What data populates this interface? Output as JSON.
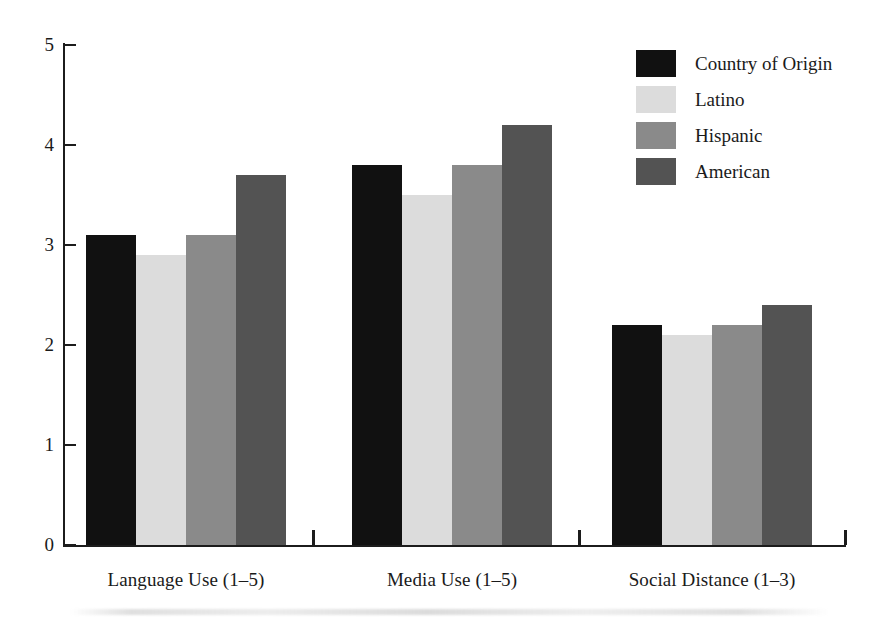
{
  "chart_data": {
    "type": "bar",
    "title": "",
    "subtitle": "",
    "xlabel": "",
    "ylabel": "",
    "ylim": [
      0,
      5
    ],
    "yticks": [
      0,
      1,
      2,
      3,
      4,
      5
    ],
    "ytick_labels": [
      "0",
      "1",
      "2",
      "3",
      "4",
      "5"
    ],
    "grid": false,
    "legend_position": "top-right",
    "categories": [
      "Language Use (1–5)",
      "Media Use (1–5)",
      "Social Distance (1–3)"
    ],
    "series": [
      {
        "name": "Country of Origin",
        "color": "#111111",
        "values": [
          3.1,
          3.8,
          2.2
        ]
      },
      {
        "name": "Latino",
        "color": "#dcdcdc",
        "values": [
          2.9,
          3.5,
          2.1
        ]
      },
      {
        "name": "Hispanic",
        "color": "#8a8a8a",
        "values": [
          3.1,
          3.8,
          2.2
        ]
      },
      {
        "name": "American",
        "color": "#535353",
        "values": [
          3.7,
          4.2,
          2.4
        ]
      }
    ]
  },
  "legend": {
    "items": [
      {
        "label": "Country of Origin",
        "swatch": "black"
      },
      {
        "label": "Latino",
        "swatch": "light"
      },
      {
        "label": "Hispanic",
        "swatch": "medium"
      },
      {
        "label": "American",
        "swatch": "dark"
      }
    ]
  },
  "axes": {
    "y_tick_labels": [
      "5",
      "4",
      "3",
      "2",
      "1",
      "0"
    ],
    "x_group_labels": [
      "Language Use (1–5)",
      "Media Use (1–5)",
      "Social Distance (1–3)"
    ]
  }
}
